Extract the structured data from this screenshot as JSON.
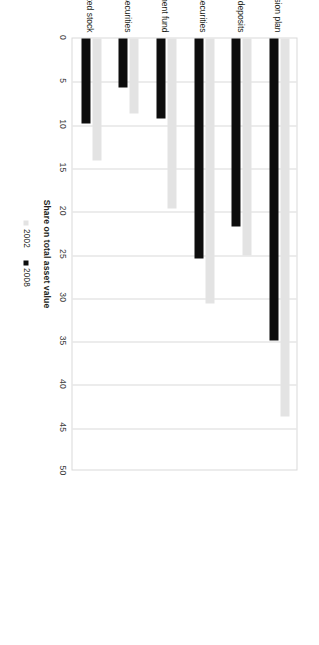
{
  "chart_data": {
    "type": "bar",
    "orientation": "horizontal",
    "title": "",
    "xlabel": "Share on total asset value",
    "ylabel": "",
    "xlim": [
      0,
      50
    ],
    "xticks": [
      0,
      5,
      10,
      15,
      20,
      25,
      30,
      35,
      40,
      45,
      50
    ],
    "grid": true,
    "legend_position": "bottom",
    "categories": [
      "Pension plan",
      "Current accounts and bank deposits",
      "Fixed income securities",
      "Investment fund",
      "Other securities",
      "Quoted stock"
    ],
    "series": [
      {
        "name": "2002",
        "color": "#e3e3e3",
        "values": [
          43.6,
          25.1,
          30.6,
          19.6,
          8.7,
          14.1
        ]
      },
      {
        "name": "2008",
        "color": "#0d0d0d",
        "values": [
          34.9,
          21.7,
          25.4,
          9.2,
          5.7,
          9.8
        ]
      }
    ]
  }
}
